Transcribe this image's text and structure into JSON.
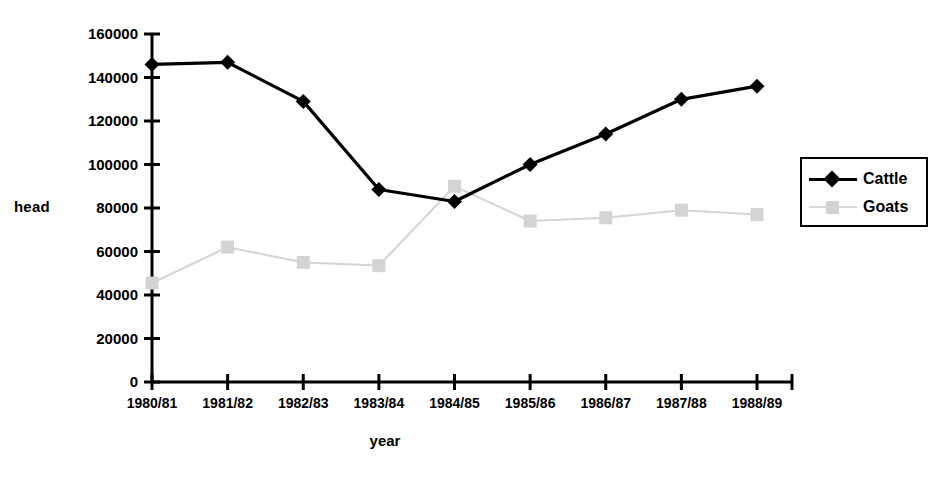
{
  "chart_data": {
    "type": "line",
    "title": "",
    "xlabel": "year",
    "ylabel": "head",
    "categories": [
      "1980/81",
      "1981/82",
      "1982/83",
      "1983/84",
      "1984/85",
      "1985/86",
      "1986/87",
      "1987/88",
      "1988/89"
    ],
    "series": [
      {
        "name": "Cattle",
        "color": "#000000",
        "marker": "diamond",
        "values": [
          146000,
          147000,
          129000,
          88500,
          83000,
          100000,
          114000,
          130000,
          136000
        ]
      },
      {
        "name": "Goats",
        "color": "#d4d4d4",
        "marker": "square",
        "values": [
          45500,
          62000,
          55000,
          53500,
          90000,
          74000,
          75500,
          79000,
          77000
        ]
      }
    ],
    "ylim": [
      0,
      160000
    ],
    "yticks": [
      0,
      20000,
      40000,
      60000,
      80000,
      100000,
      120000,
      140000,
      160000
    ],
    "ytick_labels": [
      "0",
      "20000",
      "40000",
      "60000",
      "80000",
      "100000",
      "120000",
      "140000",
      "160000"
    ],
    "grid": false,
    "legend_position": "right"
  },
  "legend": {
    "entries": [
      {
        "label": "Cattle"
      },
      {
        "label": "Goats"
      }
    ]
  }
}
